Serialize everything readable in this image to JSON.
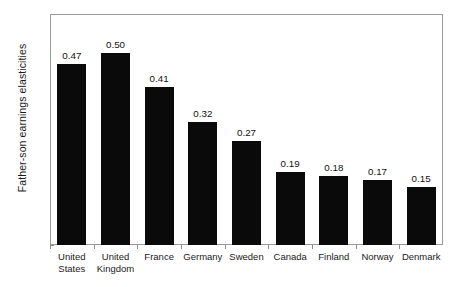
{
  "chart_data": {
    "type": "bar",
    "title": "",
    "subtitle": "",
    "xlabel": "",
    "ylabel": "Father-son earnings elasticities",
    "ylim": [
      0,
      0.6
    ],
    "ytick_labels": [
      "0",
      "0.1",
      "0.2",
      "0.3",
      "0.4",
      "0.5",
      "0.6"
    ],
    "ytick_values": [
      0,
      0.1,
      0.2,
      0.3,
      0.4,
      0.5,
      0.6
    ],
    "grid": false,
    "legend": false,
    "legend_position": "none",
    "bar_color": "#0a0a0a",
    "frame_color": "#9a9a9a",
    "categories": [
      "United States",
      "United Kingdom",
      "France",
      "Germany",
      "Sweden",
      "Canada",
      "Finland",
      "Norway",
      "Denmark"
    ],
    "category_lines": [
      [
        "United",
        "States"
      ],
      [
        "United",
        "Kingdom"
      ],
      [
        "France"
      ],
      [
        "Germany"
      ],
      [
        "Sweden"
      ],
      [
        "Canada"
      ],
      [
        "Finland"
      ],
      [
        "Norway"
      ],
      [
        "Denmark"
      ]
    ],
    "values": [
      0.47,
      0.5,
      0.41,
      0.32,
      0.27,
      0.19,
      0.18,
      0.17,
      0.15
    ],
    "value_labels": [
      "0.47",
      "0.50",
      "0.41",
      "0.32",
      "0.27",
      "0.19",
      "0.18",
      "0.17",
      "0.15"
    ]
  }
}
